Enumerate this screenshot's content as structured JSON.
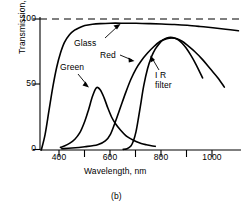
{
  "figure": {
    "caption": "(b)"
  },
  "axes": {
    "x": {
      "title": "Wavelength, nm",
      "ticks": [
        "400",
        "600",
        "800",
        "1000"
      ],
      "minor_ticks": [
        "500",
        "700",
        "900"
      ],
      "min": 325,
      "max": 1110
    },
    "y": {
      "title": "Transmission, %",
      "ticks": [
        "0",
        "50",
        "100"
      ],
      "min": 0,
      "max": 105
    }
  },
  "curve_labels": {
    "glass": "Glass",
    "green": "Green",
    "red": "Red",
    "ir_filter_line1": "I R",
    "ir_filter_line2": "filter"
  },
  "colors": {
    "line": "#000000",
    "background": "#ffffff",
    "axis": "#000000"
  },
  "chart_data": {
    "type": "line",
    "title": "",
    "subtitle": "",
    "xlabel": "Wavelength, nm",
    "ylabel": "Transmission, %",
    "xlim": [
      325,
      1110
    ],
    "ylim": [
      0,
      105
    ],
    "xticks": [
      400,
      600,
      800,
      1000
    ],
    "xticks_minor": [
      500,
      700,
      900
    ],
    "yticks": [
      0,
      50,
      100
    ],
    "grid": false,
    "legend": "inline-annotations",
    "annotations": [
      {
        "text": "Glass",
        "points_to_x": 620,
        "points_to_y": 97
      },
      {
        "text": "Green",
        "points_to_x": 520,
        "points_to_y": 40
      },
      {
        "text": "Red",
        "points_to_x": 740,
        "points_to_y": 72
      },
      {
        "text": "IR filter",
        "points_to_x": 790,
        "points_to_y": 80
      }
    ],
    "reference_lines": [
      {
        "y": 100,
        "style": "dashed",
        "label": "100% reference"
      }
    ],
    "series": [
      {
        "name": "Glass",
        "x": [
          330,
          345,
          360,
          375,
          390,
          405,
          420,
          440,
          460,
          480,
          500,
          530,
          560,
          600,
          650,
          700,
          750,
          800,
          850,
          900,
          950,
          1000,
          1050,
          1100
        ],
        "y": [
          0,
          12,
          30,
          48,
          63,
          74,
          82,
          88,
          91.5,
          93.5,
          95,
          96,
          96.5,
          96.8,
          96.8,
          96.7,
          96.5,
          96.2,
          95.8,
          95.2,
          94.3,
          93.3,
          92.2,
          91
        ]
      },
      {
        "name": "Green",
        "x": [
          405,
          420,
          440,
          460,
          480,
          500,
          515,
          530,
          545,
          560,
          575,
          590,
          605,
          620,
          640,
          660,
          680,
          700,
          720,
          740,
          760,
          775
        ],
        "y": [
          2,
          3,
          5,
          8,
          13,
          22,
          31,
          41,
          47.5,
          46,
          40,
          32,
          25,
          20,
          15,
          11,
          8.5,
          6.5,
          5,
          4,
          3.2,
          2.8
        ]
      },
      {
        "name": "Red",
        "x": [
          410,
          450,
          500,
          550,
          580,
          600,
          620,
          640,
          660,
          680,
          700,
          720,
          745,
          770,
          795,
          820,
          840,
          860,
          880,
          900,
          930,
          960,
          990,
          1020,
          1045
        ],
        "y": [
          1,
          1.5,
          2.5,
          4,
          7,
          12,
          22,
          33,
          44,
          54,
          62,
          68,
          74,
          79,
          83,
          85,
          85.5,
          85,
          83,
          80,
          75,
          69,
          62,
          55,
          48
        ]
      },
      {
        "name": "IR filter",
        "x": [
          650,
          665,
          680,
          690,
          700,
          710,
          720,
          730,
          745,
          760,
          775,
          790,
          805,
          820,
          835,
          850,
          865,
          880,
          895,
          915,
          935,
          960
        ],
        "y": [
          0.5,
          1,
          3,
          7,
          14,
          25,
          37,
          49,
          62,
          71,
          77,
          81,
          84,
          85.5,
          86,
          85.5,
          84,
          81.5,
          78,
          72,
          65,
          55
        ]
      }
    ]
  }
}
